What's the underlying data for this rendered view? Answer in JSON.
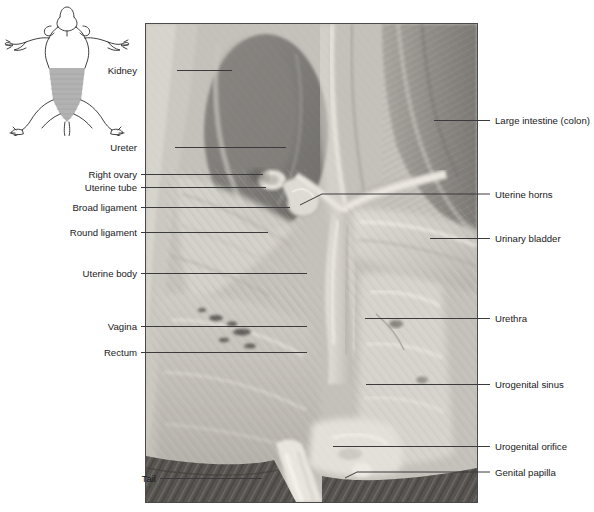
{
  "figure": {
    "panel_border_color": "#4a4a4a",
    "leader_color": "#3b3b3d",
    "label_color": "#19191a"
  },
  "orientation_key": {
    "name": "rat-body-outline",
    "outline_color": "#2b2b2b",
    "region_fill": "#b0b0b0",
    "region_description": "shaded abdominopelvic region"
  },
  "photo": {
    "name": "specimen-photograph",
    "alt": "Grayscale photograph of a dissected female rat abdominopelvic cavity",
    "bottom_band": "hatched dark dissection tray surface"
  },
  "labels_left": [
    {
      "id": "kidney",
      "text": "Kidney",
      "text_x": 137,
      "y": 70,
      "line_x2": 232
    },
    {
      "id": "ureter",
      "text": "Ureter",
      "text_x": 137,
      "y": 147,
      "line_x2": 286
    },
    {
      "id": "right-ovary",
      "text": "Right ovary",
      "text_x": 137,
      "y": 174,
      "line_x2": 263
    },
    {
      "id": "uterine-tube",
      "text": "Uterine tube",
      "text_x": 137,
      "y": 187,
      "line_x2": 266
    },
    {
      "id": "broad-ligament",
      "text": "Broad ligament",
      "text_x": 137,
      "y": 207,
      "line_x2": 290
    },
    {
      "id": "round-ligament",
      "text": "Round ligament",
      "text_x": 137,
      "y": 232,
      "line_x2": 268
    },
    {
      "id": "uterine-body",
      "text": "Uterine body",
      "text_x": 137,
      "y": 273,
      "line_x2": 307
    },
    {
      "id": "vagina",
      "text": "Vagina",
      "text_x": 137,
      "y": 326,
      "line_x2": 307
    },
    {
      "id": "rectum",
      "text": "Rectum",
      "text_x": 137,
      "y": 352,
      "line_x2": 307
    },
    {
      "id": "tail",
      "text": "Tail",
      "text_x": 137,
      "y": 478,
      "line_x2": 262
    }
  ],
  "labels_right": [
    {
      "id": "large-intestine",
      "text": "Large intestine (colon)",
      "text_x": 495,
      "y": 120,
      "line_x1": 434
    },
    {
      "id": "uterine-horns",
      "text": "Uterine horns",
      "text_x": 495,
      "y": 194,
      "line_x1": 300
    },
    {
      "id": "urinary-bladder",
      "text": "Urinary bladder",
      "text_x": 495,
      "y": 238,
      "line_x1": 430
    },
    {
      "id": "urethra",
      "text": "Urethra",
      "text_x": 495,
      "y": 318,
      "line_x1": 365
    },
    {
      "id": "urogenital-sinus",
      "text": "Urogenital sinus",
      "text_x": 495,
      "y": 384,
      "line_x1": 366
    },
    {
      "id": "urogenital-orifice",
      "text": "Urogenital orifice",
      "text_x": 495,
      "y": 446,
      "line_x1": 333
    },
    {
      "id": "genital-papilla",
      "text": "Genital papilla",
      "text_x": 495,
      "y": 472,
      "line_x1": 345
    }
  ]
}
